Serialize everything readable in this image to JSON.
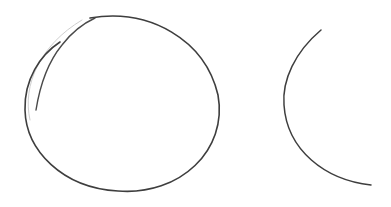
{
  "drawing": {
    "style": "pencil-sketch",
    "background": "#ffffff",
    "stroke_color": "#3a3a3a",
    "faint_stroke_color": "#c8c8c8",
    "shapes": [
      {
        "kind": "circle",
        "label": "closed-circle",
        "cx": 122,
        "cy": 104,
        "rx": 97,
        "ry": 88
      },
      {
        "kind": "arc",
        "label": "open-arc",
        "start": [
          321,
          30
        ],
        "leftmost": [
          284,
          100
        ],
        "end": [
          371,
          185
        ]
      }
    ]
  }
}
